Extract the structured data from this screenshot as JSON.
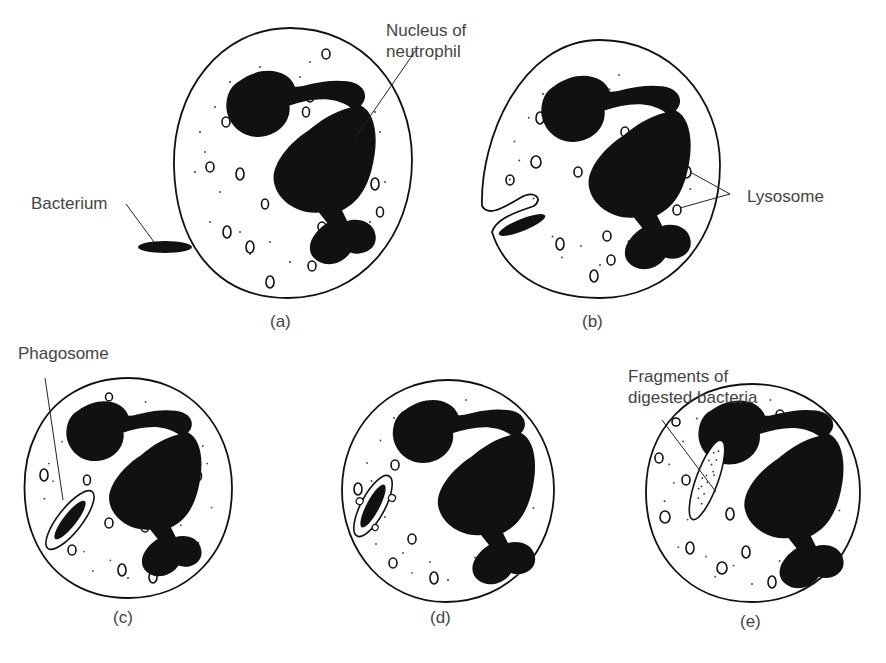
{
  "diagram": {
    "panels": [
      {
        "id": "a",
        "caption": "(a)"
      },
      {
        "id": "b",
        "caption": "(b)"
      },
      {
        "id": "c",
        "caption": "(c)"
      },
      {
        "id": "d",
        "caption": "(d)"
      },
      {
        "id": "e",
        "caption": "(e)"
      }
    ],
    "labels": {
      "nucleus_line1": "Nucleus of",
      "nucleus_line2": "neutrophil",
      "bacterium": "Bacterium",
      "lysosome": "Lysosome",
      "phagosome": "Phagosome",
      "fragments_line1": "Fragments of",
      "fragments_line2": "digested bacteria"
    },
    "colors": {
      "ink": "#111111",
      "text": "#444444",
      "background": "#ffffff"
    }
  }
}
